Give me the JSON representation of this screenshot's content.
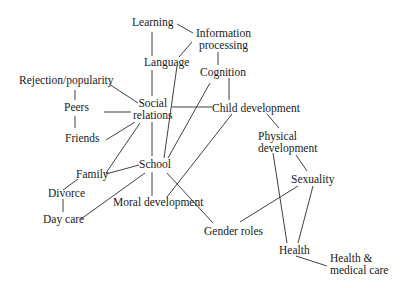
{
  "diagram": {
    "type": "concept-network",
    "nodes": {
      "learning": {
        "label": "Learning"
      },
      "information_processing": {
        "line1": "Information",
        "line2": "processing"
      },
      "language": {
        "label": "Language"
      },
      "cognition": {
        "label": "Cognition"
      },
      "rejection_popularity": {
        "label": "Rejection/popularity"
      },
      "peers": {
        "label": "Peers"
      },
      "social_relations": {
        "line1": "Social",
        "line2": "relations"
      },
      "child_development": {
        "label": "Child development"
      },
      "friends": {
        "label": "Friends"
      },
      "physical_development": {
        "line1": "Physical",
        "line2": "development"
      },
      "school": {
        "label": "School"
      },
      "family": {
        "label": "Family"
      },
      "sexuality": {
        "label": "Sexuality"
      },
      "divorce": {
        "label": "Divorce"
      },
      "moral_development": {
        "label": "Moral development"
      },
      "day_care": {
        "label": "Day care"
      },
      "gender_roles": {
        "label": "Gender roles"
      },
      "health": {
        "label": "Health"
      },
      "health_medical_care": {
        "line1": "Health &",
        "line2": "medical care"
      }
    },
    "edges": [
      [
        "Learning",
        "Information processing"
      ],
      [
        "Learning",
        "Language"
      ],
      [
        "Information processing",
        "Cognition"
      ],
      [
        "Information processing",
        "School"
      ],
      [
        "Language",
        "Social relations"
      ],
      [
        "Cognition",
        "Child development"
      ],
      [
        "Cognition",
        "School"
      ],
      [
        "Rejection/popularity",
        "Social relations"
      ],
      [
        "Peers",
        "Social relations"
      ],
      [
        "Peers",
        "Friends"
      ],
      [
        "Friends",
        "Social relations"
      ],
      [
        "Social relations",
        "Child development"
      ],
      [
        "Social relations",
        "School"
      ],
      [
        "Social relations",
        "Family"
      ],
      [
        "Child development",
        "Physical development"
      ],
      [
        "Child development",
        "Moral development"
      ],
      [
        "Family",
        "School"
      ],
      [
        "Family",
        "Divorce"
      ],
      [
        "Divorce",
        "Day care"
      ],
      [
        "School",
        "Day care"
      ],
      [
        "School",
        "Moral development"
      ],
      [
        "School",
        "Gender roles"
      ],
      [
        "Physical development",
        "Sexuality"
      ],
      [
        "Physical development",
        "Health"
      ],
      [
        "Sexuality",
        "Gender roles"
      ],
      [
        "Sexuality",
        "Health"
      ],
      [
        "Health",
        "Health & medical care"
      ]
    ]
  }
}
